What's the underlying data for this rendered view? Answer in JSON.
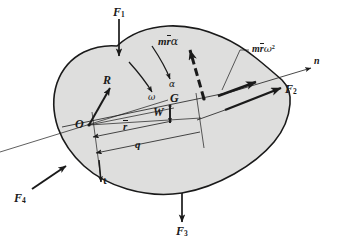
{
  "figure": {
    "background_color": "#ffffff",
    "body_fill_color": "#dededd",
    "body_stroke_color": "#1a1a1a",
    "line_color": "#1a1a1a"
  },
  "labels": {
    "force_1": "F",
    "force_1_sub": "1",
    "force_2": "F",
    "force_2_sub": "2",
    "force_3": "F",
    "force_3_sub": "3",
    "force_4": "F",
    "force_4_sub": "4",
    "reaction": "R",
    "weight": "W",
    "pivot": "O",
    "center_of_gravity": "G",
    "r_bar": "r",
    "q": "q",
    "omega": "ω",
    "alpha": "α",
    "normal_axis": "n",
    "tangential_axis": "t",
    "inertia_tangential_m": "m",
    "inertia_tangential_r": "r",
    "inertia_tangential_alpha": "α",
    "inertia_normal_m": "m",
    "inertia_normal_r": "r",
    "inertia_normal_omega": "ω",
    "inertia_normal_exp": "2"
  },
  "elements": {
    "body_outline": "irregular-blob",
    "force_1_arrow": "arrow-down",
    "force_2_arrow": "arrow-up-right",
    "force_3_arrow": "arrow-down",
    "force_4_arrow": "arrow-up-right",
    "reaction_arrow": "arrow-up-right",
    "weight_arrow": "arrow-down-short",
    "omega_arrow": "curved-arrow",
    "alpha_arrow": "curved-arrow",
    "inertia_tangential_arrow": "dashed-thick-arrow-up-right",
    "inertia_normal_arrow": "solid-thick-arrow-right",
    "n_axis_arrow": "arrow-up-right",
    "t_axis_arrow": "arrow-down",
    "dimension_r_bar": "dimension-line-with-arrow",
    "dimension_q": "dimension-line-with-arrow",
    "dimension_outer": "dimension-line-with-arrow",
    "leader_line_inertia_normal": "leader-line"
  }
}
